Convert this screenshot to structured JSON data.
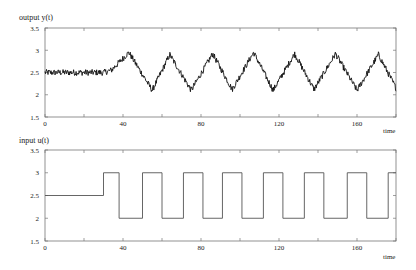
{
  "chart_data": [
    {
      "type": "line",
      "title": "output y(t)",
      "xlabel": "time",
      "ylabel": "output y(t)",
      "xlim": [
        0,
        180
      ],
      "ylim": [
        1.5,
        3.5
      ],
      "xticks": [
        0,
        40,
        80,
        120,
        160
      ],
      "xtick_labels": [
        "0",
        "40",
        "80",
        "120",
        "160"
      ],
      "yticks": [
        1.5,
        2,
        2.5,
        3,
        3.5
      ],
      "ytick_labels": [
        "1.5",
        "2",
        "2.5",
        "3",
        "3.5"
      ],
      "grid": false,
      "legend": null,
      "noise_amplitude": 0.07,
      "series": [
        {
          "name": "y(t)",
          "description": "noisy signal flat ~2.5 until t~30, then triangular oscillation between ~2.1 and ~2.95 following the input square wave",
          "x": [
            0,
            30,
            34,
            43,
            55,
            64,
            75,
            86,
            96,
            107,
            117,
            128,
            138,
            149,
            160,
            171,
            180
          ],
          "values": [
            2.5,
            2.5,
            2.55,
            2.95,
            2.1,
            2.9,
            2.1,
            2.92,
            2.12,
            2.95,
            2.1,
            2.92,
            2.12,
            2.92,
            2.1,
            2.9,
            2.15
          ]
        }
      ]
    },
    {
      "type": "line",
      "title": "input u(t)",
      "xlabel": "time",
      "ylabel": "input u(t)",
      "xlim": [
        0,
        180
      ],
      "ylim": [
        1.5,
        3.5
      ],
      "xticks": [
        0,
        40,
        80,
        120,
        160
      ],
      "xtick_labels": [
        "0",
        "40",
        "80",
        "120",
        "160"
      ],
      "yticks": [
        1.5,
        2,
        2.5,
        3,
        3.5
      ],
      "ytick_labels": [
        "1.5",
        "2",
        "2.5",
        "3",
        "3.5"
      ],
      "grid": false,
      "legend": null,
      "series": [
        {
          "name": "u(t)",
          "step": true,
          "x": [
            0,
            30,
            38,
            50,
            60,
            71,
            81,
            91,
            101,
            112,
            122,
            133,
            143,
            155,
            165,
            176,
            180
          ],
          "values": [
            2.5,
            3,
            2,
            3,
            2,
            3,
            2,
            3,
            2,
            3,
            2,
            3,
            2,
            3,
            2,
            3,
            3
          ]
        }
      ]
    }
  ],
  "plots": {
    "top": {
      "label": "output y(t)",
      "xlabel": "time"
    },
    "bottom": {
      "label": "input u(t)",
      "xlabel": "time"
    }
  },
  "colors": {
    "line": "#111111",
    "step_line": "#555555",
    "axis": "#777777"
  }
}
